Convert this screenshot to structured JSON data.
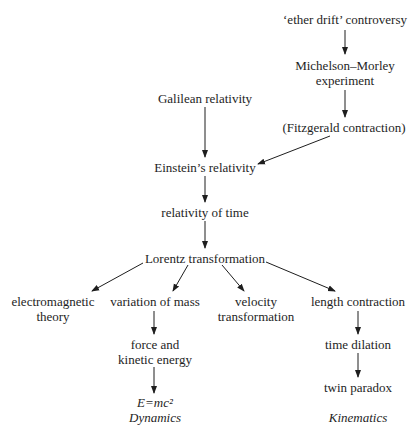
{
  "nodes": {
    "ether_drift": {
      "lines": [
        "‘ether drift’ controversy"
      ]
    },
    "michelson_morley": {
      "lines": [
        "Michelson–Morley",
        "experiment"
      ]
    },
    "fitzgerald": {
      "lines": [
        "(Fitzgerald contraction)"
      ]
    },
    "galilean": {
      "lines": [
        "Galilean relativity"
      ]
    },
    "einstein": {
      "lines": [
        "Einstein’s relativity"
      ]
    },
    "relativity_time": {
      "lines": [
        "relativity of time"
      ]
    },
    "lorentz": {
      "lines": [
        "Lorentz transformation"
      ]
    },
    "electromagnetic": {
      "lines": [
        "electromagnetic",
        "theory"
      ]
    },
    "variation_mass": {
      "lines": [
        "variation of mass"
      ]
    },
    "velocity": {
      "lines": [
        "velocity",
        "transformation"
      ]
    },
    "length_contraction": {
      "lines": [
        "length contraction"
      ]
    },
    "force_energy": {
      "lines": [
        "force and",
        "kinetic energy"
      ]
    },
    "time_dilation": {
      "lines": [
        "time dilation"
      ]
    },
    "twin_paradox": {
      "lines": [
        "twin paradox"
      ]
    },
    "emc2": {
      "lines": [
        "E=mc²"
      ]
    },
    "dynamics_label": {
      "lines": [
        "Dynamics"
      ]
    },
    "kinematics_label": {
      "lines": [
        "Kinematics"
      ]
    }
  },
  "edges": [
    {
      "from": "ether_drift",
      "to": "michelson_morley"
    },
    {
      "from": "michelson_morley",
      "to": "fitzgerald"
    },
    {
      "from": "galilean",
      "to": "einstein"
    },
    {
      "from": "fitzgerald",
      "to": "einstein"
    },
    {
      "from": "einstein",
      "to": "relativity_time"
    },
    {
      "from": "relativity_time",
      "to": "lorentz"
    },
    {
      "from": "lorentz",
      "to": "electromagnetic"
    },
    {
      "from": "lorentz",
      "to": "variation_mass"
    },
    {
      "from": "lorentz",
      "to": "velocity"
    },
    {
      "from": "lorentz",
      "to": "length_contraction"
    },
    {
      "from": "variation_mass",
      "to": "force_energy"
    },
    {
      "from": "force_energy",
      "to": "emc2"
    },
    {
      "from": "length_contraction",
      "to": "time_dilation"
    },
    {
      "from": "time_dilation",
      "to": "twin_paradox"
    }
  ],
  "colors": {
    "ink": "#1e1e1e",
    "background": "#ffffff"
  }
}
